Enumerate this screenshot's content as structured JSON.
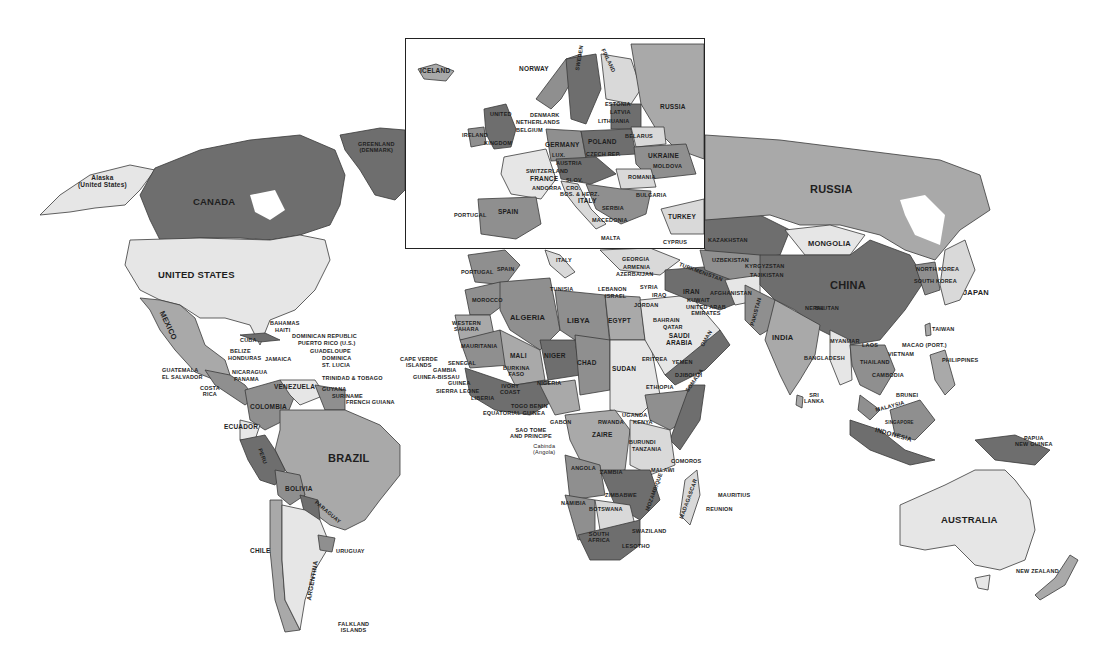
{
  "map": {
    "type": "world political map",
    "style": "grayscale",
    "inset": {
      "region": "Europe",
      "labels": [
        {
          "id": "iceland",
          "text": "ICELAND"
        },
        {
          "id": "norway",
          "text": "NORWAY"
        },
        {
          "id": "sweden",
          "text": "SWEDEN"
        },
        {
          "id": "finland",
          "text": "FINLAND"
        },
        {
          "id": "russia",
          "text": "RUSSIA"
        },
        {
          "id": "estonia",
          "text": "ESTONIA"
        },
        {
          "id": "latvia",
          "text": "LATVIA"
        },
        {
          "id": "lithuania",
          "text": "LITHUANIA"
        },
        {
          "id": "denmark",
          "text": "DENMARK"
        },
        {
          "id": "netherlands",
          "text": "NETHERLANDS"
        },
        {
          "id": "belgium",
          "text": "BELGIUM"
        },
        {
          "id": "united",
          "text": "UNITED"
        },
        {
          "id": "kingdom",
          "text": "KINGDOM"
        },
        {
          "id": "ireland",
          "text": "IRELAND"
        },
        {
          "id": "germany",
          "text": "GERMANY"
        },
        {
          "id": "poland",
          "text": "POLAND"
        },
        {
          "id": "belarus",
          "text": "BELARUS"
        },
        {
          "id": "ukraine",
          "text": "UKRAINE"
        },
        {
          "id": "moldova",
          "text": "MOLDOVA"
        },
        {
          "id": "luxembourg",
          "text": "LUX."
        },
        {
          "id": "czech",
          "text": "CZECH REP."
        },
        {
          "id": "austria",
          "text": "AUSTRIA"
        },
        {
          "id": "switzerland",
          "text": "SWITZERLAND"
        },
        {
          "id": "france",
          "text": "FRANCE"
        },
        {
          "id": "andorra",
          "text": "ANDORRA"
        },
        {
          "id": "romania",
          "text": "ROMANIA"
        },
        {
          "id": "slovenia",
          "text": "SLOV."
        },
        {
          "id": "croatia",
          "text": "CRO."
        },
        {
          "id": "bosnia",
          "text": "BOS. & HERZ."
        },
        {
          "id": "italy",
          "text": "ITALY"
        },
        {
          "id": "serbia",
          "text": "SERBIA"
        },
        {
          "id": "bulgaria",
          "text": "BULGARIA"
        },
        {
          "id": "portugal",
          "text": "PORTUGAL"
        },
        {
          "id": "spain",
          "text": "SPAIN"
        },
        {
          "id": "macedonia",
          "text": "MACEDONIA"
        },
        {
          "id": "turkey",
          "text": "TURKEY"
        },
        {
          "id": "malta",
          "text": "MALTA"
        },
        {
          "id": "cyprus",
          "text": "CYPRUS"
        }
      ]
    },
    "labels": {
      "alaska": "Alaska",
      "alaska_sub": "(United States)",
      "canada": "CANADA",
      "greenland": "GREENLAND",
      "greenland_sub": "(DENMARK)",
      "united_states": "UNITED STATES",
      "mexico": "MEXICO",
      "bahamas": "BAHAMAS",
      "haiti": "HAITI",
      "dominican_republic": "DOMINICAN REPUBLIC",
      "puerto_rico": "PUERTO RICO (U.S.)",
      "cuba": "CUBA",
      "guadeloupe": "GUADELOUPE",
      "dominica": "DOMINICA",
      "st_lucia": "ST. LUCIA",
      "belize": "BELIZE",
      "honduras": "HONDURAS",
      "jamaica": "JAMAICA",
      "guatemala": "GUATEMALA",
      "el_salvador": "EL SALVADOR",
      "nicaragua": "NICARAGUA",
      "panama": "PANAMA",
      "costa_rica_1": "COSTA",
      "costa_rica_2": "RICA",
      "trinidad": "TRINIDAD & TOBAGO",
      "venezuela": "VENEZUELA",
      "guyana": "GUYANA",
      "suriname": "SURINAME",
      "french_guiana": "FRENCH GUIANA",
      "colombia": "COLOMBIA",
      "ecuador": "ECUADOR",
      "peru": "PERU",
      "brazil": "BRAZIL",
      "bolivia": "BOLIVIA",
      "paraguay": "PARAGUAY",
      "chile": "CHILE",
      "argentina": "ARGENTINA",
      "uruguay": "URUGUAY",
      "falkland_1": "FALKLAND",
      "falkland_2": "ISLANDS",
      "portugal": "PORTUGAL",
      "spain": "SPAIN",
      "italy": "ITALY",
      "tunisia": "TUNISIA",
      "morocco": "MOROCCO",
      "algeria": "ALGERIA",
      "libya": "LIBYA",
      "egypt": "EGYPT",
      "western_sahara_1": "WESTERN",
      "western_sahara_2": "SAHARA",
      "mauritania": "MAURITANIA",
      "mali": "MALI",
      "niger": "NIGER",
      "chad": "CHAD",
      "sudan": "SUDAN",
      "cape_verde_1": "CAPE VERDE",
      "cape_verde_2": "ISLANDS",
      "senegal": "SENEGAL",
      "gambia": "GAMBIA",
      "guinea_bissau": "GUINEA-BISSAU",
      "guinea": "GUINEA",
      "sierra_leone": "SIERRA LEONE",
      "liberia": "LIBERIA",
      "burkina_1": "BURKINA",
      "burkina_2": "FASO",
      "ivory_coast_1": "IVORY",
      "ivory_coast_2": "COAST",
      "nigeria": "NIGERIA",
      "togo_benin": "TOGO BENIN",
      "equatorial_guinea": "EQUATORIAL GUINEA",
      "sao_tome_1": "SAO TOME",
      "sao_tome_2": "AND PRINCIPE",
      "cabinda_1": "Cabinda",
      "cabinda_2": "(Angola)",
      "gabon": "GABON",
      "eritrea": "ERITREA",
      "djibouti": "DJIBOUTI",
      "ethiopia": "ETHIOPIA",
      "somalia": "SOMALIA",
      "uganda": "UGANDA",
      "kenya": "KENYA",
      "rwanda": "RWANDA",
      "zaire": "ZAIRE",
      "burundi": "BURUNDI",
      "tanzania": "TANZANIA",
      "comoros": "COMOROS",
      "angola": "ANGOLA",
      "zambia": "ZAMBIA",
      "malawi": "MALAWI",
      "mozambique": "MOZAMBIQUE",
      "madagascar": "MADAGASCAR",
      "mauritius": "MAURITIUS",
      "reunion": "REUNION",
      "namibia": "NAMIBIA",
      "zimbabwe": "ZIMBABWE",
      "botswana": "BOTSWANA",
      "south_africa_1": "SOUTH",
      "south_africa_2": "AFRICA",
      "swaziland": "SWAZILAND",
      "lesotho": "LESOTHO",
      "georgia": "GEORGIA",
      "armenia": "ARMENIA",
      "azerbaijan": "AZERBAIJAN",
      "lebanon": "LEBANON",
      "israel": "ISRAEL",
      "syria": "SYRIA",
      "iraq": "IRAQ",
      "jordan": "JORDAN",
      "iran": "IRAN",
      "kuwait": "KUWAIT",
      "uae_1": "UNITED ARAB",
      "uae_2": "EMIRATES",
      "bahrain": "BAHRAIN",
      "qatar": "QATAR",
      "saudi_1": "SAUDI",
      "saudi_2": "ARABIA",
      "yemen": "YEMEN",
      "oman": "OMAN",
      "kazakhstan": "KAZAKHSTAN",
      "turkmenistan": "TURKMENISTAN",
      "uzbekistan": "UZBEKISTAN",
      "kyrgyzstan": "KYRGYZSTAN",
      "tajikistan": "TAJIKISTAN",
      "afghanistan": "AFGHANISTAN",
      "pakistan": "PAKISTAN",
      "india": "INDIA",
      "nepal": "NEPAL",
      "bhutan": "BHUTAN",
      "bangladesh": "BANGLADESH",
      "sri_lanka_1": "SRI",
      "sri_lanka_2": "LANKA",
      "russia": "RUSSIA",
      "mongolia": "MONGOLIA",
      "china": "CHINA",
      "north_korea": "NORTH KOREA",
      "south_korea": "SOUTH KOREA",
      "japan": "JAPAN",
      "taiwan": "TAIWAN",
      "macao": "MACAO (PORT.)",
      "myanmar": "MYANMAR",
      "laos": "LAOS",
      "thailand": "THAILAND",
      "vietnam": "VIETNAM",
      "cambodia": "CAMBODIA",
      "philippines": "PHILIPPINES",
      "brunei": "BRUNEI",
      "malaysia": "MALAYSIA",
      "singapore": "SINGAPORE",
      "indonesia": "INDONESIA",
      "papua_1": "PAPUA",
      "papua_2": "NEW GUINEA",
      "australia": "AUSTRALIA",
      "new_zealand": "NEW ZEALAND"
    }
  }
}
